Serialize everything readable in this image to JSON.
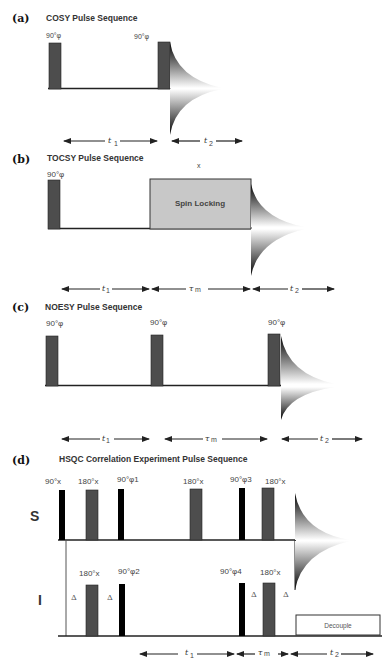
{
  "colors": {
    "pulse_gray": "#4d4d4d",
    "pulse_black": "#000000",
    "spinlock_fill": "#c8c8c8",
    "baseline": "#222222"
  },
  "panels": {
    "a": {
      "label": "(a)",
      "title": "COSY Pulse Sequence",
      "pulses": [
        "90°φ",
        "90°φ"
      ],
      "intervals": [
        "t1",
        "t2"
      ]
    },
    "b": {
      "label": "(b)",
      "title": "TOCSY Pulse Sequence",
      "pulses": [
        "90°φ"
      ],
      "spinlock_phase": "x",
      "spinlock_label": "Spin Locking",
      "intervals": [
        "t1",
        "τm",
        "t2"
      ]
    },
    "c": {
      "label": "(c)",
      "title": "NOESY Pulse Sequence",
      "pulses": [
        "90°φ",
        "90°φ",
        "90°φ"
      ],
      "intervals": [
        "t1",
        "τm",
        "t2"
      ]
    },
    "d": {
      "label": "(d)",
      "title": "HSQC Correlation Experiment Pulse Sequence",
      "channels": [
        "S",
        "I"
      ],
      "s_pulses": [
        "90°x",
        "180°x",
        "90°φ1",
        "180°x",
        "90°φ3",
        "180°x"
      ],
      "i_pulses": [
        "180°x",
        "90°φ2",
        "90°φ4",
        "180°x"
      ],
      "delay": "Δ",
      "decouple_label": "Decouple",
      "intervals": [
        "t1",
        "τm",
        "t2"
      ]
    }
  },
  "interval_text": {
    "t": "t",
    "one": "1",
    "two": "2",
    "tau": "τ",
    "m": "m"
  }
}
